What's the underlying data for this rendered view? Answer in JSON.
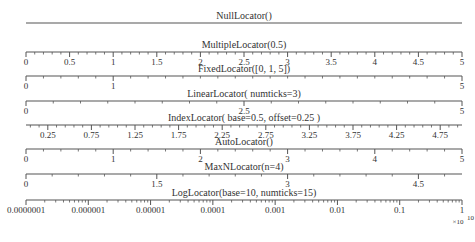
{
  "chart_data": {
    "type": "table",
    "xlim": [
      0,
      5
    ],
    "axes": [
      {
        "name": "null-locator",
        "title": "NullLocator()",
        "major": [],
        "minor": [],
        "labels": []
      },
      {
        "name": "multiple-locator",
        "title": "MultipleLocator(0.5)",
        "major": [
          0,
          0.5,
          1,
          1.5,
          2,
          2.5,
          3,
          3.5,
          4,
          4.5,
          5
        ],
        "minor": [
          0.1,
          0.2,
          0.3,
          0.4,
          0.6,
          0.7,
          0.8,
          0.9,
          1.1,
          1.2,
          1.3,
          1.4,
          1.6,
          1.7,
          1.8,
          1.9,
          2.1,
          2.2,
          2.3,
          2.4,
          2.6,
          2.7,
          2.8,
          2.9,
          3.1,
          3.2,
          3.3,
          3.4,
          3.6,
          3.7,
          3.8,
          3.9,
          4.1,
          4.2,
          4.3,
          4.4,
          4.6,
          4.7,
          4.8,
          4.9
        ],
        "labels": [
          "0",
          "0.5",
          "1",
          "1.5",
          "2",
          "2.5",
          "3",
          "3.5",
          "4",
          "4.5",
          "5"
        ]
      },
      {
        "name": "fixed-locator",
        "title": "FixedLocator([0, 1, 5])",
        "major": [
          0,
          1,
          5
        ],
        "minor": [
          0.2,
          0.4,
          0.6,
          0.8,
          1.2,
          1.4,
          1.6,
          1.8,
          2.0,
          2.2,
          2.4,
          2.6,
          2.8,
          3.0,
          3.2,
          3.4,
          3.6,
          3.8,
          4.0,
          4.2,
          4.4,
          4.6,
          4.8
        ],
        "labels": [
          "0",
          "1",
          "5"
        ]
      },
      {
        "name": "linear-locator",
        "title": "LinearLocator( numticks=3)",
        "major": [
          0,
          2.5,
          5
        ],
        "minor": [
          0.3125,
          0.625,
          0.9375,
          1.25,
          1.5625,
          1.875,
          2.1875,
          2.8125,
          3.125,
          3.4375,
          3.75,
          4.0625,
          4.375,
          4.6875
        ],
        "labels": [
          "0",
          "2.5",
          "5"
        ]
      },
      {
        "name": "index-locator",
        "title": "IndexLocator( base=0.5, offset=0.25 )",
        "major": [
          0.25,
          0.75,
          1.25,
          1.75,
          2.25,
          2.75,
          3.25,
          3.75,
          4.25,
          4.75
        ],
        "minor": [
          0.05,
          0.15,
          0.35,
          0.45,
          0.55,
          0.65,
          0.85,
          0.95,
          1.05,
          1.15,
          1.35,
          1.45,
          1.55,
          1.65,
          1.85,
          1.95,
          2.05,
          2.15,
          2.35,
          2.45,
          2.55,
          2.65,
          2.85,
          2.95,
          3.05,
          3.15,
          3.35,
          3.45,
          3.55,
          3.65,
          3.85,
          3.95,
          4.05,
          4.15,
          4.35,
          4.45,
          4.55,
          4.65,
          4.85,
          4.95
        ],
        "labels": [
          "0.25",
          "0.75",
          "1.25",
          "1.75",
          "2.25",
          "2.75",
          "3.25",
          "3.75",
          "4.25",
          "4.75"
        ]
      },
      {
        "name": "auto-locator",
        "title": "AutoLocator()",
        "major": [
          0,
          1,
          2,
          3,
          4,
          5
        ],
        "minor": [
          0.2,
          0.4,
          0.6,
          0.8,
          1.2,
          1.4,
          1.6,
          1.8,
          2.2,
          2.4,
          2.6,
          2.8,
          3.2,
          3.4,
          3.6,
          3.8,
          4.2,
          4.4,
          4.6,
          4.8
        ],
        "labels": [
          "0",
          "1",
          "2",
          "3",
          "4",
          "5"
        ]
      },
      {
        "name": "maxn-locator",
        "title": "MaxNLocator(n=4)",
        "major": [
          0,
          1.5,
          3,
          4.5
        ],
        "minor": [
          0.3,
          0.6,
          0.9,
          1.2,
          1.8,
          2.1,
          2.4,
          2.7,
          3.3,
          3.6,
          3.9,
          4.2,
          4.8
        ],
        "labels": [
          "0",
          "1.5",
          "3",
          "4.5"
        ]
      },
      {
        "name": "log-locator",
        "title": "LogLocator(base=10, numticks=15)",
        "scale": "log",
        "xlim_log10": [
          -7,
          0
        ],
        "major": [
          -7,
          -6,
          -5,
          -4,
          -3,
          -2,
          -1,
          0
        ],
        "labels": [
          "0.0000001",
          "0.000001",
          "0.00001",
          "0.0001",
          "0.001",
          "0.01",
          "0.1",
          "1"
        ],
        "offset_text": "×10",
        "offset_exponent": "10"
      }
    ]
  }
}
